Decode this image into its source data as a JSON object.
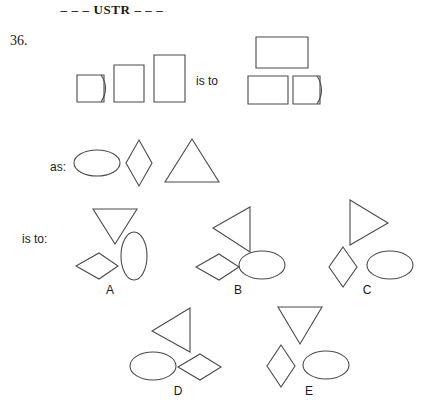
{
  "header": {
    "title": "– – – USTR – – –"
  },
  "item": {
    "number": "36.",
    "connector_is_to": "is to",
    "connector_as": "as:",
    "connector_is_to_colon": "is to:"
  },
  "stem": {
    "left_group": {
      "name": "three-rectangles-ascending",
      "shapes": [
        {
          "kind": "square-with-curved-right-side",
          "label": "small square bulged right"
        },
        {
          "kind": "rectangle",
          "label": "medium upright rectangle"
        },
        {
          "kind": "rectangle",
          "label": "tall upright rectangle"
        }
      ]
    },
    "right_group": {
      "name": "three-rectangles-stacked",
      "shapes": [
        {
          "kind": "rectangle",
          "label": "wide rectangle on top"
        },
        {
          "kind": "rectangle",
          "label": "rectangle lower left"
        },
        {
          "kind": "square-with-curved-right-side",
          "label": "square bulged right lower right"
        }
      ]
    }
  },
  "analogy_row": {
    "name": "ellipse-diamond-triangle",
    "shapes": [
      {
        "kind": "ellipse-horizontal",
        "label": "horizontal ellipse"
      },
      {
        "kind": "diamond-vertical",
        "label": "tall diamond"
      },
      {
        "kind": "triangle-up",
        "label": "upward triangle"
      }
    ]
  },
  "options": [
    {
      "id": "A",
      "label": "A",
      "shapes": [
        {
          "kind": "triangle-down",
          "label": "downward triangle"
        },
        {
          "kind": "ellipse-vertical",
          "label": "vertical ellipse"
        },
        {
          "kind": "diamond-horizontal",
          "label": "flat diamond"
        }
      ]
    },
    {
      "id": "B",
      "label": "B",
      "shapes": [
        {
          "kind": "triangle-left",
          "label": "left-pointing triangle"
        },
        {
          "kind": "diamond-horizontal",
          "label": "flat diamond"
        },
        {
          "kind": "ellipse-horizontal",
          "label": "horizontal ellipse"
        }
      ]
    },
    {
      "id": "C",
      "label": "C",
      "shapes": [
        {
          "kind": "triangle-right",
          "label": "right-pointing triangle"
        },
        {
          "kind": "diamond-vertical",
          "label": "tall diamond"
        },
        {
          "kind": "ellipse-horizontal",
          "label": "horizontal ellipse"
        }
      ]
    },
    {
      "id": "D",
      "label": "D",
      "shapes": [
        {
          "kind": "triangle-left",
          "label": "left-pointing triangle"
        },
        {
          "kind": "ellipse-horizontal",
          "label": "horizontal ellipse"
        },
        {
          "kind": "diamond-horizontal",
          "label": "flat diamond"
        }
      ]
    },
    {
      "id": "E",
      "label": "E",
      "shapes": [
        {
          "kind": "triangle-down",
          "label": "downward triangle"
        },
        {
          "kind": "diamond-vertical",
          "label": "tall diamond"
        },
        {
          "kind": "ellipse-horizontal",
          "label": "horizontal ellipse"
        }
      ]
    }
  ],
  "colors": {
    "background": "#ffffff",
    "stroke": "#4a4a4a",
    "text": "#1a1a1a"
  }
}
